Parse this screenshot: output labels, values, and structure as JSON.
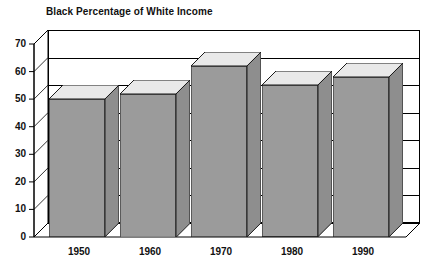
{
  "chart_data": {
    "type": "bar",
    "title": "Black Percentage of White Income",
    "xlabel": "",
    "ylabel": "",
    "categories": [
      "1950",
      "1960",
      "1970",
      "1980",
      "1990"
    ],
    "values": [
      50,
      52,
      62,
      55,
      58
    ],
    "ylim": [
      0,
      70
    ],
    "yticks": [
      0,
      10,
      20,
      30,
      40,
      50,
      60,
      70
    ],
    "ytick_labels": [
      "0",
      "10",
      "20",
      "30",
      "40",
      "50",
      "60",
      "70"
    ],
    "grid": true,
    "legend": false,
    "style": "3d-column",
    "colors": {
      "bar_face": "#9b9b9b",
      "bar_side": "#8e8e8e",
      "bar_top": "#e9e9e9",
      "outline": "#1a1a1a",
      "background": "#ffffff",
      "text": "#111111"
    }
  }
}
